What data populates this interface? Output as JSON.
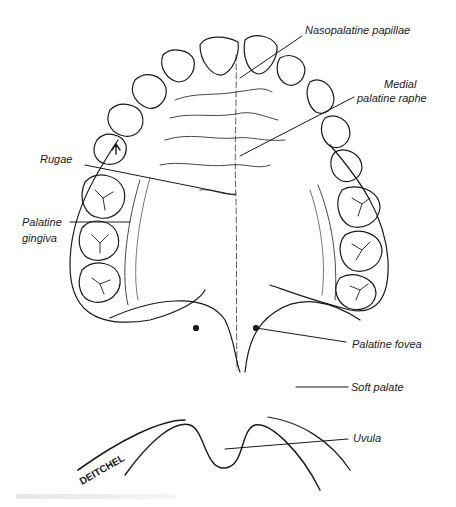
{
  "figure": {
    "type": "anatomical line illustration",
    "artist_signature": "DEITCHEL",
    "labels": {
      "nasopalatine": "Nasopalatine papillae",
      "medial_1": "Medial",
      "medial_2": "palatine raphe",
      "rugae": "Rugae",
      "gingiva_1": "Palatine",
      "gingiva_2": "gingiva",
      "fovea": "Palatine fovea",
      "soft_palate": "Soft palate",
      "uvula": "Uvula"
    },
    "colors": {
      "ink": "#1a1a1a",
      "background": "#ffffff",
      "caption": "#e6e6e6"
    }
  }
}
